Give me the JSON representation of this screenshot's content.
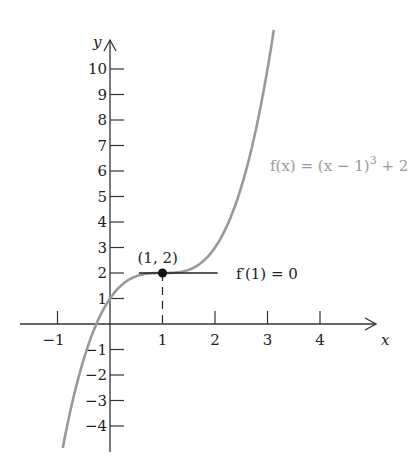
{
  "chart_data": {
    "type": "line",
    "title": "",
    "xlabel": "x",
    "ylabel": "y",
    "xlim": [
      -1.5,
      4.8
    ],
    "ylim": [
      -4.6,
      11
    ],
    "x_ticks": [
      "-1",
      "1",
      "2",
      "3",
      "4"
    ],
    "y_ticks": [
      "-4",
      "-3",
      "-2",
      "-1",
      "1",
      "2",
      "3",
      "4",
      "5",
      "6",
      "7",
      "8",
      "9",
      "10"
    ],
    "series": [
      {
        "name": "f(x) = (x − 1)^3 + 2",
        "function": "(x-1)^3+2",
        "color": "#999999"
      }
    ],
    "annotations": [
      {
        "text": "(1, 2)",
        "x": 1,
        "y": 2,
        "type": "point"
      },
      {
        "text": "f′(1) = 0",
        "type": "horizontal tangent at x=1"
      }
    ],
    "grid": false
  },
  "labels": {
    "x_axis": "x",
    "y_axis": "y",
    "func": "f(x) = (x − 1)",
    "func_exp": "3",
    "func_tail": " + 2",
    "point": "(1, 2)",
    "deriv": "f′(1) = 0"
  }
}
